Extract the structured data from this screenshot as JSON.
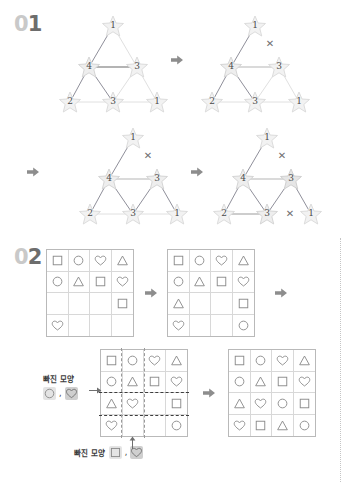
{
  "page": {
    "width": 350,
    "height": 486,
    "background": "#ffffff"
  },
  "sections": [
    {
      "id": "01",
      "zero": "0",
      "digit": "1"
    },
    {
      "id": "02",
      "zero": "0",
      "digit": "2"
    }
  ],
  "colors": {
    "section_zero": "#c9c9c9",
    "section_digit": "#6d6d6d",
    "arrow": "#8d8d8d",
    "grid_border": "#b9b9b9",
    "grid_line": "#d8d8d8",
    "shape_stroke": "#8a8a8a",
    "edge_dark": "#8f8f9a",
    "edge_light": "#dcdcdc",
    "star_fill": "#f2f2f2",
    "xmark": "#6f6f6f",
    "dash_highlight": "#3d3d3d"
  },
  "icons": {
    "arrow": "arrow-right-icon",
    "xmark": "x-mark-icon",
    "star": "star-icon"
  },
  "section1": {
    "label": "01",
    "node_labels": {
      "top": "1",
      "mid_left": "4",
      "mid_right": "3",
      "bottom_left": "2",
      "bottom_mid": "3",
      "bottom_right": "1"
    },
    "steps": [
      {
        "name": "step-1",
        "x_marks": [],
        "edges_dark": [
          "top-midleft",
          "midleft-midright",
          "midleft-bottomleft",
          "midleft-bottommid"
        ],
        "edges_light": [
          "top-midright",
          "midright-bottommid",
          "midright-bottomright",
          "bottomleft-bottommid",
          "bottommid-bottomright"
        ]
      },
      {
        "name": "step-2",
        "x_marks": [
          "top-midright"
        ],
        "edges_dark": [
          "top-midleft",
          "midleft-midright",
          "midleft-bottomleft",
          "midleft-bottommid"
        ],
        "edges_light": [
          "midright-bottommid",
          "midright-bottomright",
          "bottomleft-bottommid",
          "bottommid-bottomright"
        ]
      },
      {
        "name": "step-3",
        "x_marks": [
          "top-midright"
        ],
        "edges_dark": [
          "top-midleft",
          "midleft-midright",
          "midleft-bottomleft",
          "midleft-bottommid",
          "midright-bottommid",
          "midright-bottomright"
        ],
        "edges_light": [
          "bottomleft-bottommid",
          "bottommid-bottomright"
        ]
      },
      {
        "name": "step-4",
        "x_marks": [
          "top-midright",
          "bottommid-bottomright"
        ],
        "edges_dark": [
          "top-midleft",
          "midleft-midright",
          "midleft-bottomleft",
          "midleft-bottommid",
          "midright-bottommid",
          "midright-bottomright",
          "bottomleft-bottommid"
        ],
        "edges_light": []
      }
    ],
    "arrows": [
      "arrow-1",
      "arrow-2",
      "arrow-3"
    ]
  },
  "section2": {
    "label": "02",
    "shape_names": [
      "square",
      "circle",
      "heart",
      "triangle"
    ],
    "grids": [
      {
        "name": "grid-1",
        "rows": [
          [
            "square",
            "circle",
            "heart",
            "triangle"
          ],
          [
            "circle",
            "triangle",
            "square",
            "heart"
          ],
          [
            "",
            "",
            "",
            "square"
          ],
          [
            "heart",
            "",
            "",
            ""
          ]
        ]
      },
      {
        "name": "grid-2",
        "rows": [
          [
            "square",
            "circle",
            "heart",
            "triangle"
          ],
          [
            "circle",
            "triangle",
            "square",
            "heart"
          ],
          [
            "triangle",
            "",
            "",
            "square"
          ],
          [
            "heart",
            "",
            "",
            "circle"
          ]
        ]
      },
      {
        "name": "grid-3",
        "rows": [
          [
            "square",
            "circle",
            "heart",
            "triangle"
          ],
          [
            "circle",
            "triangle",
            "square",
            "heart"
          ],
          [
            "triangle",
            "heart",
            "",
            "square"
          ],
          [
            "heart",
            "",
            "",
            "circle"
          ]
        ]
      },
      {
        "name": "grid-4",
        "rows": [
          [
            "square",
            "circle",
            "heart",
            "triangle"
          ],
          [
            "circle",
            "triangle",
            "square",
            "heart"
          ],
          [
            "triangle",
            "heart",
            "circle",
            "square"
          ],
          [
            "heart",
            "square",
            "triangle",
            "circle"
          ]
        ]
      }
    ],
    "callouts": [
      {
        "name": "callout-row",
        "text": "빠진 모양",
        "chips": [
          "circle",
          "heart"
        ],
        "separator": ","
      },
      {
        "name": "callout-column",
        "text": "빠진 모양",
        "chips": [
          "square",
          "heart"
        ],
        "separator": ","
      }
    ],
    "arrows": [
      "arrow-4",
      "arrow-5",
      "arrow-6"
    ]
  }
}
